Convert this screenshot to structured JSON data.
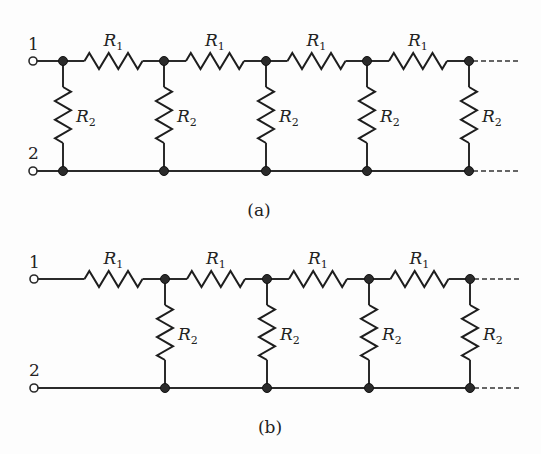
{
  "figure": {
    "type": "ladder-resistor-network",
    "panels": [
      {
        "id": "a",
        "caption": "(a)",
        "terminals": {
          "top": "1",
          "bottom": "2"
        },
        "first_element": "shunt",
        "series_resistor_label": {
          "main": "R",
          "sub": "1"
        },
        "shunt_resistor_label": {
          "main": "R",
          "sub": "2"
        },
        "series_count": 4,
        "shunt_count": 5,
        "continues_right": true
      },
      {
        "id": "b",
        "caption": "(b)",
        "terminals": {
          "top": "1",
          "bottom": "2"
        },
        "first_element": "series",
        "series_resistor_label": {
          "main": "R",
          "sub": "1"
        },
        "shunt_resistor_label": {
          "main": "R",
          "sub": "2"
        },
        "series_count": 4,
        "shunt_count": 4,
        "continues_right": true
      }
    ],
    "colors": {
      "ink": "#222222",
      "background": "#fdfdfd",
      "node_fill": "#2b2b2b"
    }
  }
}
